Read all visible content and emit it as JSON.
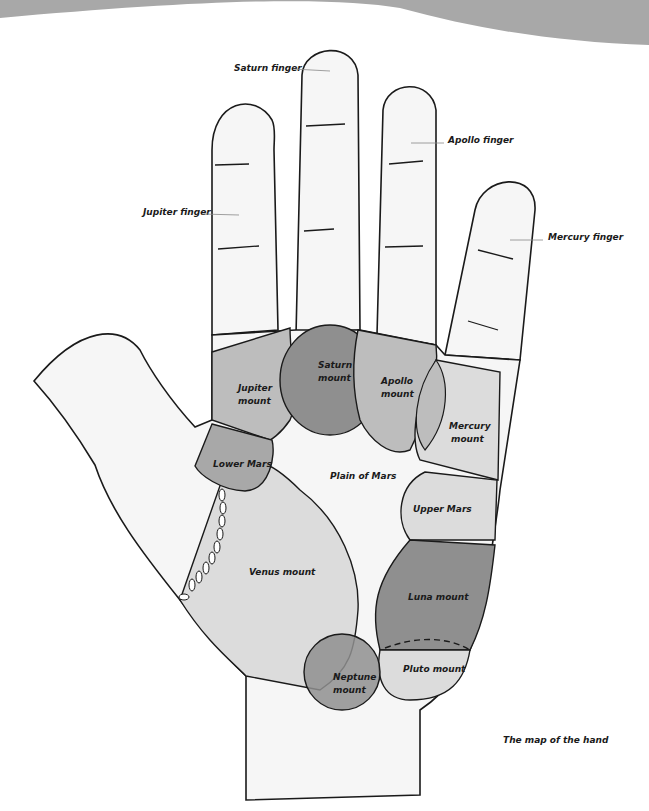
{
  "diagram": {
    "caption": "The map of the hand",
    "colors": {
      "banner": "#a8a8a8",
      "finger_fill": "#f6f6f6",
      "light_mount": "#dcdcdc",
      "mid_mount": "#bdbdbd",
      "dark_mount": "#8f8f8f",
      "outline": "#1a1a1a"
    },
    "finger_labels": {
      "saturn": "Saturn finger",
      "apollo": "Apollo finger",
      "jupiter": "Jupiter finger",
      "mercury": "Mercury finger"
    },
    "mounts": {
      "jupiter": [
        "Jupiter",
        "mount"
      ],
      "saturn": [
        "Saturn",
        "mount"
      ],
      "apollo": [
        "Apollo",
        "mount"
      ],
      "mercury": [
        "Mercury",
        "mount"
      ],
      "lower_mars": "Lower Mars",
      "plain_of_mars": "Plain of Mars",
      "upper_mars": "Upper Mars",
      "venus": "Venus mount",
      "luna": "Luna mount",
      "neptune": [
        "Neptune",
        "mount"
      ],
      "pluto": "Pluto mount"
    }
  }
}
